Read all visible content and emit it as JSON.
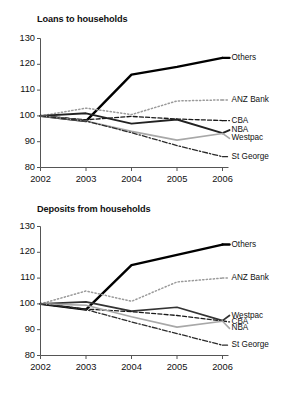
{
  "chart_data": [
    {
      "type": "line",
      "title": "Loans to households",
      "xlabel": "",
      "ylabel": "",
      "x": [
        2002,
        2003,
        2004,
        2005,
        2006
      ],
      "xticklabels": [
        "2002",
        "2003",
        "2004",
        "2005",
        "2006"
      ],
      "yticks": [
        80,
        90,
        100,
        110,
        120,
        130
      ],
      "yticklabels": [
        "80",
        "90",
        "100",
        "110",
        "120",
        "130"
      ],
      "ylim": [
        80,
        130
      ],
      "xlim": [
        2002,
        2006
      ],
      "grid": false,
      "legend_position": "right-inline",
      "series": [
        {
          "name": "Others",
          "label": "Others",
          "values": [
            100,
            98,
            116,
            119,
            122.5
          ],
          "style": "solid",
          "color": "#000000",
          "width": 2.4,
          "label_y": 122.5
        },
        {
          "name": "ANZ Bank",
          "label": "ANZ Bank",
          "values": [
            100,
            103,
            100.5,
            105.8,
            106.2
          ],
          "style": "dotted",
          "color": "#9a9a9a",
          "width": 1.5,
          "label_y": 106.2
        },
        {
          "name": "CBA",
          "label": "CBA",
          "values": [
            100,
            98.5,
            99.8,
            98.8,
            98.2
          ],
          "style": "dashed",
          "color": "#1a1a1a",
          "width": 1.3,
          "label_y": 98.2
        },
        {
          "name": "NBA",
          "label": "NBA",
          "values": [
            100,
            101,
            97,
            98.6,
            93.3
          ],
          "style": "solid",
          "color": "#222222",
          "width": 1.9,
          "label_y": 94.5
        },
        {
          "name": "Westpac",
          "label": "Westpac",
          "values": [
            100,
            98,
            94,
            90.6,
            93.2
          ],
          "style": "solid",
          "color": "#a8a8a8",
          "width": 1.6,
          "label_y": 91.3
        },
        {
          "name": "St George",
          "label": "St George",
          "values": [
            100,
            98,
            93.5,
            88.5,
            84.2
          ],
          "style": "dashdot",
          "color": "#2a2a2a",
          "width": 1.3,
          "label_y": 84.2
        }
      ]
    },
    {
      "type": "line",
      "title": "Deposits from households",
      "xlabel": "",
      "ylabel": "",
      "x": [
        2002,
        2003,
        2004,
        2005,
        2006
      ],
      "xticklabels": [
        "2002",
        "2003",
        "2004",
        "2005",
        "2006"
      ],
      "yticks": [
        80,
        90,
        100,
        110,
        120,
        130
      ],
      "yticklabels": [
        "80",
        "90",
        "100",
        "110",
        "120",
        "130"
      ],
      "ylim": [
        80,
        130
      ],
      "xlim": [
        2002,
        2006
      ],
      "grid": false,
      "legend_position": "right-inline",
      "series": [
        {
          "name": "Others",
          "label": "Others",
          "values": [
            100,
            97.8,
            115,
            119,
            123
          ],
          "style": "solid",
          "color": "#000000",
          "width": 2.4,
          "label_y": 123
        },
        {
          "name": "ANZ Bank",
          "label": "ANZ Bank",
          "values": [
            100,
            105,
            101,
            108.5,
            110
          ],
          "style": "dotted",
          "color": "#9a9a9a",
          "width": 1.5,
          "label_y": 110
        },
        {
          "name": "Westpac",
          "label": "Westpac",
          "values": [
            100,
            100.8,
            97.2,
            98.7,
            93.5
          ],
          "style": "solid",
          "color": "#333333",
          "width": 1.7,
          "label_y": 95.5
        },
        {
          "name": "CBA",
          "label": "CBA",
          "values": [
            100,
            98,
            97,
            95.5,
            93.4
          ],
          "style": "dashed",
          "color": "#1a1a1a",
          "width": 1.3,
          "label_y": 93.0
        },
        {
          "name": "NBA",
          "label": "NBA",
          "values": [
            100,
            99.5,
            95,
            91,
            93.3
          ],
          "style": "solid",
          "color": "#a8a8a8",
          "width": 1.6,
          "label_y": 90.5
        },
        {
          "name": "St George",
          "label": "St George",
          "values": [
            100,
            97.8,
            93,
            88.5,
            84
          ],
          "style": "dashdot",
          "color": "#2a2a2a",
          "width": 1.3,
          "label_y": 84
        }
      ]
    }
  ]
}
